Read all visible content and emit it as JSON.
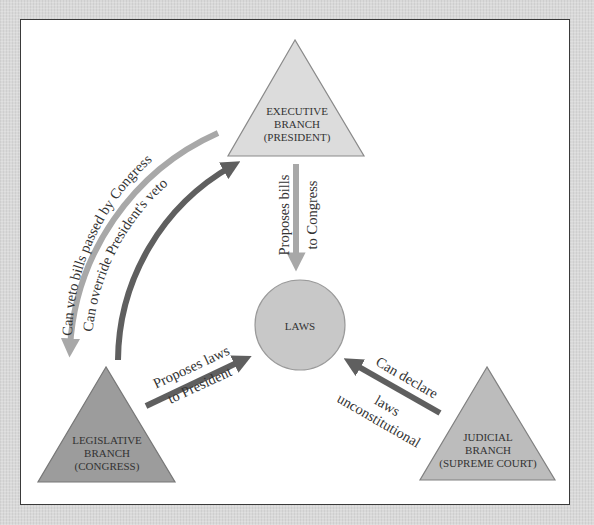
{
  "diagram": {
    "nodes": {
      "executive": {
        "line1": "EXECUTIVE",
        "line2": "BRANCH",
        "line3": "(PRESIDENT)",
        "shape": "triangle",
        "fill": "#dcdcdc"
      },
      "legislative": {
        "line1": "LEGISLATIVE",
        "line2": "BRANCH",
        "line3": "(CONGRESS)",
        "shape": "triangle",
        "fill": "#9c9c9c"
      },
      "judicial": {
        "line1": "JUDICIAL",
        "line2": "BRANCH",
        "line3": "(SUPREME COURT)",
        "shape": "triangle",
        "fill": "#bcbcbc"
      },
      "laws": {
        "label": "LAWS",
        "shape": "circle",
        "fill": "#c8c8c8"
      }
    },
    "edges": {
      "veto": {
        "label": "Can veto bills passed by Congress",
        "from": "executive",
        "to": "legislative",
        "color": "#a8a8a8"
      },
      "override": {
        "label": "Can override President's veto",
        "from": "legislative",
        "to": "executive",
        "color": "#5f5f5f"
      },
      "proposes_bills": {
        "line1": "Proposes bills",
        "line2": "to Congress",
        "from": "executive",
        "to": "laws",
        "color": "#a8a8a8"
      },
      "proposes_laws": {
        "line1": "Proposes laws",
        "line2": "to President",
        "from": "legislative",
        "to": "laws",
        "color": "#5f5f5f"
      },
      "declare": {
        "line1": "Can declare",
        "line2": "laws",
        "line3": "unconstitutional",
        "from": "judicial",
        "to": "laws",
        "color": "#5f5f5f"
      }
    }
  }
}
